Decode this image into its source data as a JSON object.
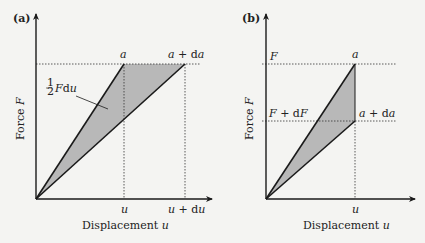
{
  "panels": [
    {
      "id": "a",
      "label": "(a)",
      "y_axis_label": "Force F",
      "x_axis_label": "Displacement u",
      "top_labels": {
        "a": "a",
        "a_da": "a + da"
      },
      "x_ticks": {
        "u": "u",
        "u_du": "u + du"
      },
      "annotation": "½ F du",
      "description": "Constant force F; crack grows from a to a+da; displacement increases from u to u+du"
    },
    {
      "id": "b",
      "label": "(b)",
      "y_axis_label": "Force F",
      "x_axis_label": "Displacement u",
      "left_labels": {
        "F": "F",
        "F_dF": "F + dF"
      },
      "point_labels": {
        "a": "a",
        "a_da": "a + da"
      },
      "x_ticks": {
        "u": "u"
      },
      "description": "Fixed displacement u; crack grows from a to a+da; force drops from F to F+dF"
    }
  ],
  "colors": {
    "line": "#1a1a1a",
    "fill": "#b8b8b8",
    "dashed": "#333333",
    "background": "#f4f4f2"
  }
}
